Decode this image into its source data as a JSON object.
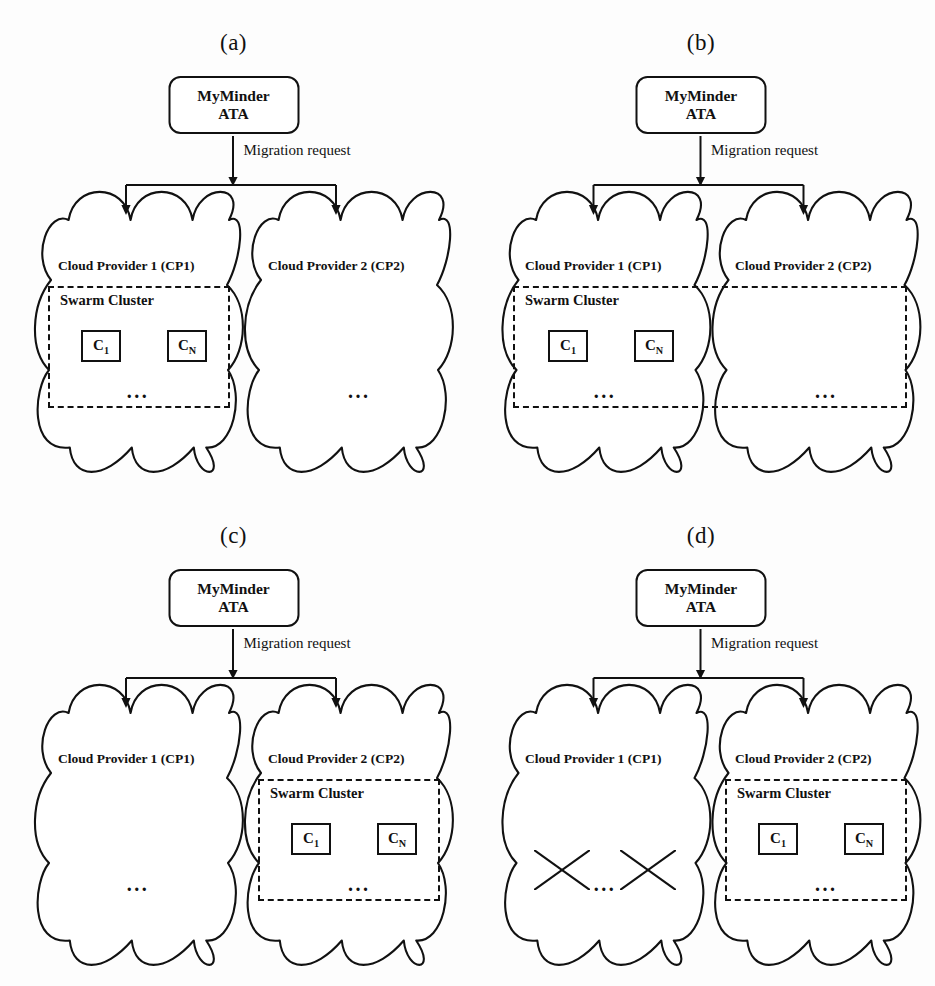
{
  "figure": {
    "migration_label": "Migration request",
    "cloud1_label": "Cloud Provider 1 (CP1)",
    "cloud2_label": "Cloud Provider 2 (CP2)",
    "swarm_label": "Swarm Cluster",
    "myminder_line1": "MyMinder",
    "myminder_line2": "ATA",
    "ellipsis": "...",
    "stroke_color": "#111111",
    "background_color": "#fdfdfd"
  },
  "panels": [
    {
      "id": "a",
      "label": "(a)",
      "swarm_scope": "cp1",
      "cp1": {
        "label": "Cloud Provider 1 (CP1)",
        "vms": [
          {
            "name": "VM",
            "sub": "1",
            "container": {
              "name": "C",
              "sub": "1"
            },
            "crossed": false
          },
          {
            "name": "VM",
            "sub": "N",
            "container": {
              "name": "C",
              "sub": "N"
            },
            "crossed": false
          }
        ]
      },
      "cp2": {
        "label": "Cloud Provider 2 (CP2)",
        "vms": [
          {
            "name": "VM",
            "sub": "new1",
            "container": null,
            "crossed": false
          },
          {
            "name": "VM",
            "sub": "newN",
            "container": null,
            "crossed": false
          }
        ]
      }
    },
    {
      "id": "b",
      "label": "(b)",
      "swarm_scope": "both",
      "cp1": {
        "label": "Cloud Provider 1 (CP1)",
        "vms": [
          {
            "name": "VM",
            "sub": "1",
            "container": {
              "name": "C",
              "sub": "1"
            },
            "crossed": false
          },
          {
            "name": "VM",
            "sub": "N",
            "container": {
              "name": "C",
              "sub": "N"
            },
            "crossed": false
          }
        ]
      },
      "cp2": {
        "label": "Cloud Provider 2 (CP2)",
        "vms": [
          {
            "name": "VM",
            "sub": "new1",
            "container": null,
            "crossed": false
          },
          {
            "name": "VM",
            "sub": "newN",
            "container": null,
            "crossed": false
          }
        ]
      }
    },
    {
      "id": "c",
      "label": "(c)",
      "swarm_scope": "cp2",
      "cp1": {
        "label": "Cloud Provider 1 (CP1)",
        "vms": [
          {
            "name": "VM",
            "sub": "1",
            "container": null,
            "crossed": false
          },
          {
            "name": "VM",
            "sub": "N",
            "container": null,
            "crossed": false
          }
        ]
      },
      "cp2": {
        "label": "Cloud Provider 2 (CP2)",
        "vms": [
          {
            "name": "VM",
            "sub": "new1",
            "container": {
              "name": "C",
              "sub": "1"
            },
            "crossed": false
          },
          {
            "name": "VM",
            "sub": "newN",
            "container": {
              "name": "C",
              "sub": "N"
            },
            "crossed": false
          }
        ]
      }
    },
    {
      "id": "d",
      "label": "(d)",
      "swarm_scope": "cp2",
      "cp1": {
        "label": "Cloud Provider 1 (CP1)",
        "vms": [
          {
            "name": "VM",
            "sub": "1",
            "container": null,
            "crossed": true
          },
          {
            "name": "VM",
            "sub": "N",
            "container": null,
            "crossed": true
          }
        ]
      },
      "cp2": {
        "label": "Cloud Provider 2 (CP2)",
        "vms": [
          {
            "name": "VM",
            "sub": "new1",
            "container": {
              "name": "C",
              "sub": "1"
            },
            "crossed": false
          },
          {
            "name": "VM",
            "sub": "newN",
            "container": {
              "name": "C",
              "sub": "N"
            },
            "crossed": false
          }
        ]
      }
    }
  ]
}
